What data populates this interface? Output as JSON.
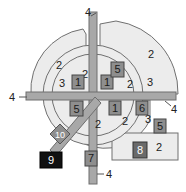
{
  "diagram": {
    "colors": {
      "sector_fill": "#ececec",
      "sector_stroke": "#707070",
      "bar_fill": "#a8a8a8",
      "bar_stroke": "#6e6e6e",
      "box_fill": "#8e8e8e",
      "box_stroke": "#444444",
      "box9_fill": "#111111"
    },
    "leader_labels": {
      "top": "4",
      "left": "4",
      "right": "4",
      "bottom": "4"
    },
    "region_labels": {
      "outer_top_left": "2",
      "outer_top_right": "2",
      "ring_top_left": "3",
      "ring_top_right": "3",
      "inner_top_left": "2",
      "inner_top_right": "2",
      "inner_bottom_left": "2",
      "inner_bottom_right": "2",
      "ring_bottom_right": "3",
      "outer_bottom_right": "2"
    },
    "boxes": {
      "b1_top_left": "1",
      "b1_top_right": "1",
      "b1_bottom_right": "1",
      "b5_top": "5",
      "b5_left": "5",
      "b5_right": "5",
      "b6": "6",
      "b7": "7",
      "b8": "8",
      "b9": "9",
      "b10": "10"
    }
  }
}
